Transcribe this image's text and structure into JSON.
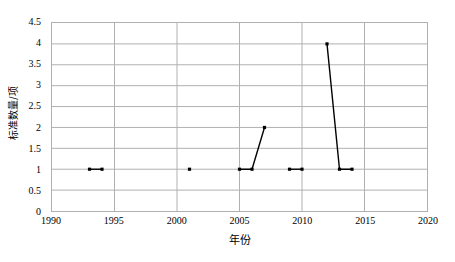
{
  "chart_data": {
    "type": "line",
    "title": "",
    "xlabel": "年份",
    "ylabel": "标准数量/项",
    "xlim": [
      1990,
      2020
    ],
    "ylim": [
      0,
      4.5
    ],
    "xticks": [
      1990,
      1995,
      2000,
      2005,
      2010,
      2015,
      2020
    ],
    "yticks": [
      0,
      0.5,
      1,
      1.5,
      2,
      2.5,
      3,
      3.5,
      4,
      4.5
    ],
    "xtick_labels": [
      "1990",
      "1995",
      "2000",
      "2005",
      "2010",
      "2015",
      "2020"
    ],
    "ytick_labels": [
      "0",
      "0.5",
      "1",
      "1.5",
      "2",
      "2.5",
      "3",
      "3.5",
      "4",
      "4.5"
    ],
    "grid": true,
    "legend": "none",
    "series_color": "#000000",
    "grid_color": "#b0b0b0",
    "marker": "square",
    "x": [
      1993,
      1994,
      2001,
      2005,
      2006,
      2007,
      2009,
      2010,
      2012,
      2013,
      2014
    ],
    "values": [
      1,
      1,
      1,
      1,
      1,
      2,
      1,
      1,
      4,
      1,
      1
    ],
    "segments": [
      {
        "name": "segment-1993-1994",
        "points": [
          [
            1993,
            1
          ],
          [
            1994,
            1
          ]
        ]
      },
      {
        "name": "segment-2001",
        "points": [
          [
            2001,
            1
          ]
        ]
      },
      {
        "name": "segment-2005-2007",
        "points": [
          [
            2005,
            1
          ],
          [
            2006,
            1
          ],
          [
            2007,
            2
          ]
        ]
      },
      {
        "name": "segment-2009-2010",
        "points": [
          [
            2009,
            1
          ],
          [
            2010,
            1
          ]
        ]
      },
      {
        "name": "segment-2012-2014",
        "points": [
          [
            2012,
            4
          ],
          [
            2013,
            1
          ],
          [
            2014,
            1
          ]
        ]
      }
    ]
  }
}
